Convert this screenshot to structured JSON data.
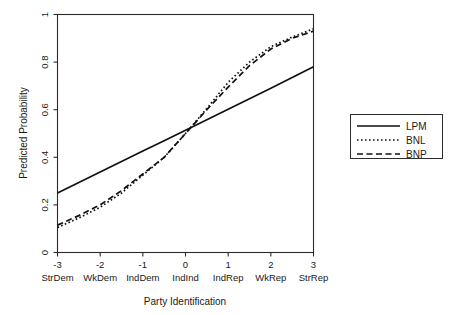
{
  "chart_data": {
    "type": "line",
    "title": "",
    "xlabel": "Party Identification",
    "ylabel": "Predicted Probability",
    "xlim": [
      -3,
      3
    ],
    "ylim": [
      0,
      1
    ],
    "grid": false,
    "legend_position": "right-outside",
    "x_tick_labels": [
      "-3",
      "-2",
      "-1",
      "0",
      "1",
      "2",
      "3"
    ],
    "x_tick_values": [
      -3,
      -2,
      -1,
      0,
      1,
      2,
      3
    ],
    "x_category_labels": [
      "StrDem",
      "WkDem",
      "IndDem",
      "IndInd",
      "IndRep",
      "WkRep",
      "StrRep"
    ],
    "y_tick_labels": [
      "0",
      "0.2",
      "0.4",
      "0.6",
      "0.8",
      "1"
    ],
    "y_tick_values": [
      0,
      0.2,
      0.4,
      0.6,
      0.8,
      1
    ],
    "x": [
      -3,
      -2.5,
      -2,
      -1.5,
      -1,
      -0.5,
      0,
      0.5,
      1,
      1.5,
      2,
      2.5,
      3
    ],
    "series": [
      {
        "name": "LPM",
        "style": "solid",
        "values": [
          0.25,
          0.294,
          0.338,
          0.382,
          0.426,
          0.47,
          0.514,
          0.558,
          0.602,
          0.646,
          0.69,
          0.735,
          0.78
        ]
      },
      {
        "name": "BNL",
        "style": "dotted",
        "values": [
          0.105,
          0.145,
          0.19,
          0.25,
          0.325,
          0.4,
          0.5,
          0.605,
          0.715,
          0.8,
          0.865,
          0.905,
          0.94
        ]
      },
      {
        "name": "BNP",
        "style": "dashed",
        "values": [
          0.115,
          0.155,
          0.2,
          0.26,
          0.33,
          0.4,
          0.5,
          0.6,
          0.695,
          0.785,
          0.855,
          0.9,
          0.93
        ]
      }
    ]
  },
  "legend": {
    "entries": [
      {
        "label": "LPM"
      },
      {
        "label": "BNL"
      },
      {
        "label": "BNP"
      }
    ]
  }
}
